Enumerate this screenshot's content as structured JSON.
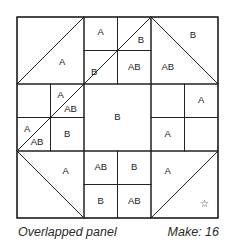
{
  "block": {
    "origin": [
      17,
      17
    ],
    "unit": 33.5,
    "grid_units": 6,
    "line_color": "#222222",
    "rects": [
      {
        "name": "outer-border",
        "x": 0,
        "y": 0,
        "w": 6,
        "h": 6
      },
      {
        "name": "square-top-left",
        "x": 0,
        "y": 0,
        "w": 2,
        "h": 2
      },
      {
        "name": "square-top-right",
        "x": 4,
        "y": 0,
        "w": 2,
        "h": 2
      },
      {
        "name": "square-bottom-left",
        "x": 0,
        "y": 4,
        "w": 2,
        "h": 2
      },
      {
        "name": "square-bottom-right",
        "x": 4,
        "y": 4,
        "w": 2,
        "h": 2
      },
      {
        "name": "square-center",
        "x": 2,
        "y": 2,
        "w": 2,
        "h": 2
      },
      {
        "name": "cell-tm-1",
        "x": 2,
        "y": 0,
        "w": 1,
        "h": 1
      },
      {
        "name": "cell-tm-2",
        "x": 3,
        "y": 0,
        "w": 1,
        "h": 1
      },
      {
        "name": "cell-tm-3",
        "x": 2,
        "y": 1,
        "w": 1,
        "h": 1
      },
      {
        "name": "cell-tm-4",
        "x": 3,
        "y": 1,
        "w": 1,
        "h": 1
      },
      {
        "name": "cell-ml-1",
        "x": 0,
        "y": 2,
        "w": 1,
        "h": 1
      },
      {
        "name": "cell-ml-2",
        "x": 1,
        "y": 2,
        "w": 1,
        "h": 1
      },
      {
        "name": "cell-ml-3",
        "x": 0,
        "y": 3,
        "w": 1,
        "h": 1
      },
      {
        "name": "cell-ml-4",
        "x": 1,
        "y": 3,
        "w": 1,
        "h": 1
      },
      {
        "name": "cell-mr-1",
        "x": 4,
        "y": 2,
        "w": 1,
        "h": 1
      },
      {
        "name": "cell-mr-2",
        "x": 5,
        "y": 2,
        "w": 1,
        "h": 1
      },
      {
        "name": "cell-mr-3",
        "x": 4,
        "y": 3,
        "w": 1,
        "h": 1
      },
      {
        "name": "cell-mr-4",
        "x": 5,
        "y": 3,
        "w": 1,
        "h": 1
      },
      {
        "name": "cell-bm-1",
        "x": 2,
        "y": 4,
        "w": 1,
        "h": 1
      },
      {
        "name": "cell-bm-2",
        "x": 3,
        "y": 4,
        "w": 1,
        "h": 1
      },
      {
        "name": "cell-bm-3",
        "x": 2,
        "y": 5,
        "w": 1,
        "h": 1
      },
      {
        "name": "cell-bm-4",
        "x": 3,
        "y": 5,
        "w": 1,
        "h": 1
      }
    ],
    "diagonals": [
      {
        "name": "diagonal-top-left",
        "x1": 0,
        "y1": 2,
        "x2": 2,
        "y2": 0
      },
      {
        "name": "diagonal-top-middle",
        "x1": 2,
        "y1": 2,
        "x2": 4,
        "y2": 0
      },
      {
        "name": "diagonal-top-right",
        "x1": 4,
        "y1": 0,
        "x2": 6,
        "y2": 2
      },
      {
        "name": "diagonal-middle-left",
        "x1": 0,
        "y1": 4,
        "x2": 2,
        "y2": 2
      },
      {
        "name": "diagonal-bottom-left",
        "x1": 0,
        "y1": 4,
        "x2": 2,
        "y2": 6
      },
      {
        "name": "diagonal-bottom-right",
        "x1": 4,
        "y1": 6,
        "x2": 6,
        "y2": 4
      }
    ],
    "labels": [
      {
        "text": "A",
        "x": 1.35,
        "y": 1.35
      },
      {
        "text": "A",
        "x": 2.5,
        "y": 0.45
      },
      {
        "text": "B",
        "x": 3.7,
        "y": 0.7
      },
      {
        "text": "B",
        "x": 2.3,
        "y": 1.65
      },
      {
        "text": "AB",
        "x": 3.5,
        "y": 1.5
      },
      {
        "text": "B",
        "x": 5.25,
        "y": 0.55
      },
      {
        "text": "AB",
        "x": 4.5,
        "y": 1.5
      },
      {
        "text": "A",
        "x": 1.3,
        "y": 2.35
      },
      {
        "text": "AB",
        "x": 1.6,
        "y": 2.75
      },
      {
        "text": "B",
        "x": 3.0,
        "y": 3.0
      },
      {
        "text": "A",
        "x": 5.5,
        "y": 2.5
      },
      {
        "text": "A",
        "x": 0.3,
        "y": 3.35
      },
      {
        "text": "AB",
        "x": 0.6,
        "y": 3.75
      },
      {
        "text": "B",
        "x": 1.5,
        "y": 3.5
      },
      {
        "text": "A",
        "x": 4.5,
        "y": 3.5
      },
      {
        "text": "A",
        "x": 1.45,
        "y": 4.6
      },
      {
        "text": "AB",
        "x": 2.5,
        "y": 4.5
      },
      {
        "text": "B",
        "x": 3.5,
        "y": 4.5
      },
      {
        "text": "A",
        "x": 4.5,
        "y": 4.6
      },
      {
        "text": "B",
        "x": 2.5,
        "y": 5.5
      },
      {
        "text": "AB",
        "x": 3.5,
        "y": 5.5
      },
      {
        "text": "☆",
        "x": 5.6,
        "y": 5.6
      }
    ]
  },
  "caption": {
    "left": "Overlapped panel",
    "right": "Make: 16"
  }
}
